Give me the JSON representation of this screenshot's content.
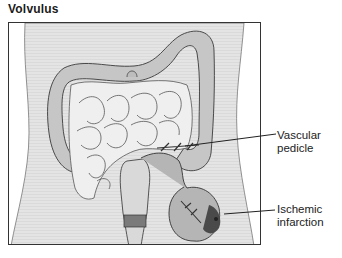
{
  "title": "Volvulus",
  "labels": {
    "vascular_pedicle": {
      "line1": "Vascular",
      "line2": "pedicle"
    },
    "ischemic_infarction": {
      "line1": "Ischemic",
      "line2": "infarction"
    }
  },
  "colors": {
    "body_silhouette": "#e6e6e6",
    "colon": "#c8c8c8",
    "small_bowel": "#ececec",
    "infarction": "#555555",
    "outline": "#333333"
  }
}
